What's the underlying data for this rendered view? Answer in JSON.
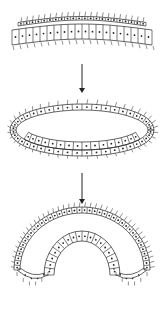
{
  "diagram": {
    "stroke_color": "#222222",
    "background": "#ffffff",
    "stages": [
      {
        "id": "stage-1",
        "shape": "flat-sheet",
        "label": ""
      },
      {
        "id": "stage-2",
        "shape": "hollow-ring",
        "label": ""
      },
      {
        "id": "stage-3",
        "shape": "invaginated-cup",
        "label": ""
      }
    ],
    "arrows": [
      {
        "from": "stage-1",
        "to": "stage-2"
      },
      {
        "from": "stage-2",
        "to": "stage-3"
      }
    ]
  }
}
